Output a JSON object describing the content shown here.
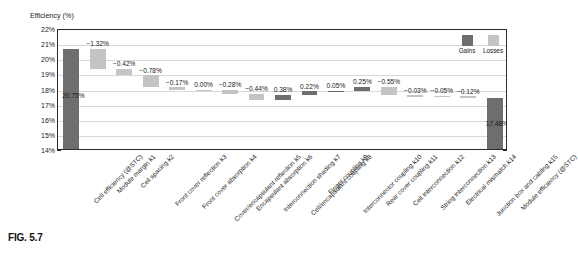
{
  "figure": {
    "caption": "FIG. 5.7"
  },
  "legend": {
    "position": "top-right-inside",
    "items": [
      {
        "label": "Gains",
        "color": "#6e6e6e"
      },
      {
        "label": "Losses",
        "color": "#c4c4c4"
      }
    ]
  },
  "chart_data": {
    "type": "bar",
    "subtype": "waterfall",
    "title": "",
    "xlabel": "",
    "ylabel": "Efficiency (%)",
    "ylim": [
      14,
      22
    ],
    "ytick_labels": [
      "22%",
      "21%",
      "20%",
      "19%",
      "18%",
      "17%",
      "16%",
      "15%",
      "14%"
    ],
    "ytick_values": [
      22,
      21,
      20,
      19,
      18,
      17,
      16,
      15,
      14
    ],
    "grid": true,
    "baseline": 14,
    "categories": [
      "Cell efficiency (@STC)",
      "Module margin k1",
      "Cell spacing k2",
      "Front cover reflection k3",
      "Front cover absorption k4",
      "Cover/encapsulant reflection k5",
      "Encapsulant absorption k6",
      "Interconnection shading k7",
      "Cell/encapsulant coupling k8",
      "Finger coupling k9",
      "Interconnector coupling k10",
      "Rear cover coupling k11",
      "Cell interconnection k12",
      "String interconnection k13",
      "Electrical mismatch k14",
      "Junction box and cabling k15",
      "Module efficiency (@STC)"
    ],
    "value_labels": [
      "20.75%",
      "−1.32%",
      "−0.42%",
      "−0.78%",
      "−0.17%",
      "0.00%",
      "−0.28%",
      "−0.44%",
      "0.38%",
      "0.22%",
      "0.05%",
      "0.25%",
      "−0.55%",
      "−0.03%",
      "−0.05%",
      "−0.12%",
      "17.48%"
    ],
    "values": [
      20.75,
      -1.32,
      -0.42,
      -0.78,
      -0.17,
      0.0,
      -0.28,
      -0.44,
      0.38,
      0.22,
      0.05,
      0.25,
      -0.55,
      -0.03,
      -0.05,
      -0.12,
      17.48
    ],
    "kinds": [
      "total",
      "loss",
      "loss",
      "loss",
      "loss",
      "zero",
      "loss",
      "loss",
      "gain",
      "gain",
      "gain",
      "gain",
      "loss",
      "loss",
      "loss",
      "loss",
      "total"
    ],
    "cumulative_start": [
      14.0,
      19.43,
      19.01,
      18.23,
      18.06,
      18.06,
      17.78,
      17.34,
      17.34,
      17.72,
      17.94,
      17.99,
      17.69,
      17.66,
      17.61,
      17.49,
      14.0
    ],
    "cumulative_end": [
      20.75,
      20.75,
      19.43,
      19.01,
      18.23,
      18.06,
      18.06,
      17.78,
      17.72,
      17.94,
      17.99,
      18.24,
      18.24,
      17.69,
      17.66,
      17.61,
      17.48
    ]
  }
}
